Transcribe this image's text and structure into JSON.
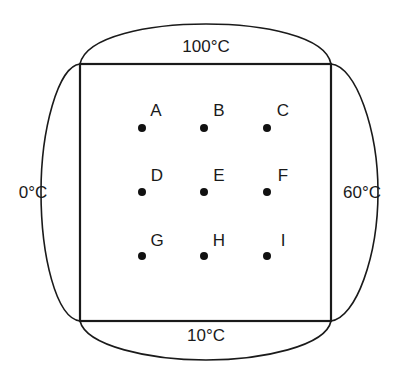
{
  "diagram": {
    "plate": {
      "x1": 80,
      "y1": 64,
      "x2": 331,
      "y2": 321
    },
    "colors": {
      "stroke": "#1a1a1a",
      "dot": "#111111",
      "background": "#ffffff"
    },
    "boundaries": {
      "top": {
        "label": "100°C",
        "x": 206,
        "y": 46
      },
      "bottom": {
        "label": "10°C",
        "x": 206,
        "y": 335
      },
      "left": {
        "label": "0°C",
        "x": 33,
        "y": 192
      },
      "right": {
        "label": "60°C",
        "x": 362,
        "y": 192
      }
    },
    "points": [
      {
        "label": "A",
        "x": 142,
        "y": 128
      },
      {
        "label": "B",
        "x": 204,
        "y": 128
      },
      {
        "label": "C",
        "x": 267,
        "y": 128
      },
      {
        "label": "D",
        "x": 142,
        "y": 192
      },
      {
        "label": "E",
        "x": 204,
        "y": 192
      },
      {
        "label": "F",
        "x": 267,
        "y": 192
      },
      {
        "label": "G",
        "x": 142,
        "y": 256
      },
      {
        "label": "H",
        "x": 204,
        "y": 256
      },
      {
        "label": "I",
        "x": 267,
        "y": 256
      }
    ],
    "label_offset": {
      "dx": 14,
      "dy": -18
    }
  }
}
